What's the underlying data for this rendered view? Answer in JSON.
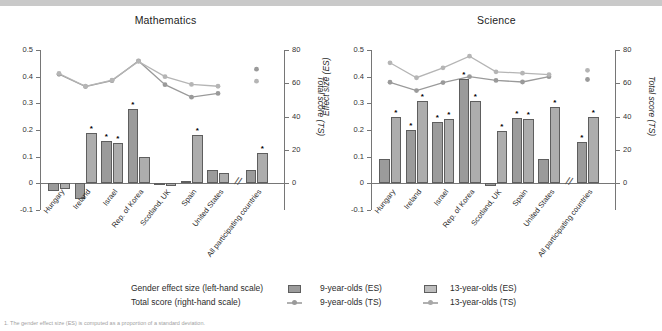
{
  "figure": {
    "caption": "1. The gender effect size (ES) is computed as a proportion of a standard deviation."
  },
  "legend": {
    "rows": [
      {
        "label": "Gender effect size (left-hand scale)",
        "series_a": "9-year-olds (ES)",
        "series_b": "13-year-olds (ES)"
      },
      {
        "label": "Total score (right-hand scale)",
        "series_a": "9-year-olds (TS)",
        "series_b": "13-year-olds (TS)"
      }
    ]
  },
  "colors": {
    "bar_9": "#9b9b9b",
    "bar_13": "#adadad",
    "line_9": "#9a9a9a",
    "line_13": "#b5b5b5",
    "axis": "#767676"
  },
  "chart_data": [
    {
      "type": "bar",
      "title": "Mathematics",
      "xlabel": "",
      "ylabel": "Effect size (ES)",
      "ylabel_right": "Total score (TS)",
      "ylim": [
        -0.1,
        0.5
      ],
      "yticks": [
        -0.1,
        0,
        0.1,
        0.2,
        0.3,
        0.4,
        0.5
      ],
      "ylim_right": [
        0,
        80
      ],
      "yticks_right": [
        0,
        20,
        40,
        60,
        80
      ],
      "grid": false,
      "legend_position": "bottom",
      "categories": [
        "Hungary",
        "Ireland",
        "Israel",
        "Rep. of Korea",
        "Scotland, UK",
        "Spain",
        "United States",
        "All participating countries"
      ],
      "axis_break_before": "All participating countries",
      "series": [
        {
          "name": "9-year-olds (ES)",
          "values": [
            -0.03,
            -0.06,
            0.16,
            0.28,
            0.0,
            0.01,
            0.05,
            0.05
          ]
        },
        {
          "name": "13-year-olds (ES)",
          "values": [
            -0.02,
            0.19,
            0.15,
            0.1,
            -0.01,
            0.18,
            0.04,
            0.115
          ]
        }
      ],
      "significant": {
        "9-year-olds (ES)": [
          false,
          false,
          true,
          true,
          false,
          false,
          false,
          false
        ],
        "13-year-olds (ES)": [
          false,
          true,
          true,
          false,
          false,
          true,
          false,
          true
        ]
      },
      "line_series": [
        {
          "name": "9-year-olds (TS)",
          "values_es_scale": [
            0.409,
            0.363,
            0.385,
            0.459,
            0.37,
            0.323,
            0.337,
            null
          ],
          "values_ts": [
            65.5,
            58.1,
            61.6,
            73.4,
            59.2,
            51.7,
            53.9,
            68.5
          ]
        },
        {
          "name": "13-year-olds (TS)",
          "values_es_scale": [
            0.412,
            0.364,
            0.387,
            0.457,
            0.4,
            0.371,
            0.364,
            null
          ],
          "values_ts": [
            65.9,
            58.2,
            61.9,
            73.1,
            64.0,
            59.4,
            58.2,
            61.3
          ]
        }
      ]
    },
    {
      "type": "bar",
      "title": "Science",
      "xlabel": "",
      "ylabel": "Effect size (ES)",
      "ylabel_right": "Total score (TS)",
      "ylim": [
        -0.1,
        0.5
      ],
      "yticks": [
        -0.1,
        0,
        0.1,
        0.2,
        0.3,
        0.4,
        0.5
      ],
      "ylim_right": [
        0,
        80
      ],
      "yticks_right": [
        0,
        20,
        40,
        60,
        80
      ],
      "grid": false,
      "legend_position": "bottom",
      "categories": [
        "Hungary",
        "Ireland",
        "Israel",
        "Rep. of Korea",
        "Scotland, UK",
        "Spain",
        "United States",
        "All participating countries"
      ],
      "axis_break_before": "All participating countries",
      "series": [
        {
          "name": "9-year-olds (ES)",
          "values": [
            0.09,
            0.2,
            0.23,
            0.39,
            -0.01,
            0.245,
            0.09,
            0.155
          ]
        },
        {
          "name": "13-year-olds (ES)",
          "values": [
            0.25,
            0.31,
            0.24,
            0.31,
            0.195,
            0.24,
            0.285,
            0.25
          ]
        }
      ],
      "significant": {
        "9-year-olds (ES)": [
          false,
          true,
          true,
          true,
          false,
          true,
          false,
          true
        ],
        "13-year-olds (ES)": [
          true,
          true,
          true,
          true,
          true,
          true,
          true,
          true
        ]
      },
      "line_series": [
        {
          "name": "9-year-olds (TS)",
          "values_es_scale": [
            0.379,
            0.348,
            0.378,
            0.4,
            0.386,
            0.38,
            0.4,
            null
          ],
          "values_ts": [
            60.6,
            55.7,
            60.4,
            64.0,
            61.8,
            60.8,
            64.0,
            62.3
          ]
        },
        {
          "name": "13-year-olds (TS)",
          "values_es_scale": [
            0.452,
            0.396,
            0.433,
            0.477,
            0.418,
            0.413,
            0.408,
            null
          ],
          "values_ts": [
            72.3,
            63.4,
            69.3,
            76.3,
            66.9,
            66.1,
            65.3,
            67.8
          ]
        }
      ]
    }
  ]
}
